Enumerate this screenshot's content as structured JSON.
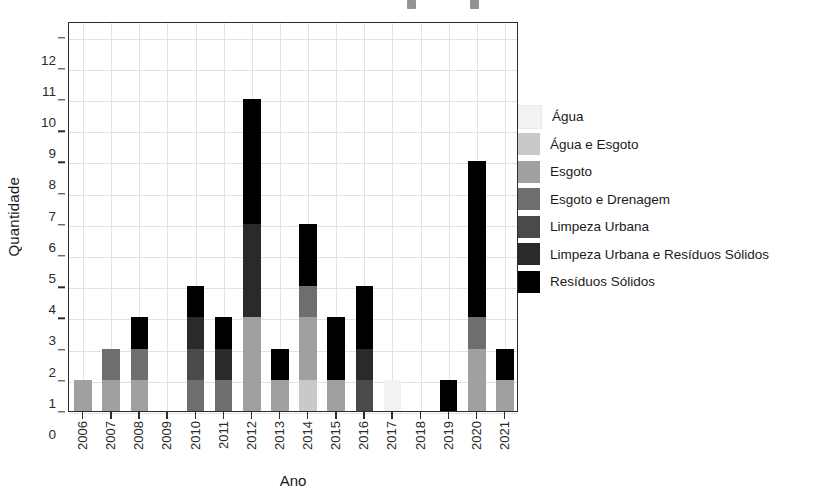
{
  "chart_data": {
    "type": "bar",
    "stacked": true,
    "title": "",
    "xlabel": "Ano",
    "ylabel": "Quantidade",
    "ylim": [
      0,
      12.5
    ],
    "yticks": [
      0,
      1,
      2,
      3,
      4,
      5,
      6,
      7,
      8,
      9,
      10,
      11,
      12
    ],
    "grid": true,
    "legend_position": "right",
    "categories": [
      "2006",
      "2007",
      "2008",
      "2009",
      "2010",
      "2011",
      "2012",
      "2013",
      "2014",
      "2015",
      "2016",
      "2017",
      "2018",
      "2019",
      "2020",
      "2021"
    ],
    "series": [
      {
        "name": "Água",
        "color": "#f2f2f2",
        "values": [
          0,
          0,
          0,
          0,
          0,
          0,
          0,
          0,
          0,
          0,
          0,
          1,
          0,
          0,
          0,
          0
        ]
      },
      {
        "name": "Água e Esgoto",
        "color": "#c9c9c9",
        "values": [
          0,
          0,
          0,
          0,
          0,
          0,
          0,
          0,
          1,
          0,
          0,
          0,
          0,
          0,
          0,
          0
        ]
      },
      {
        "name": "Esgoto",
        "color": "#a0a0a0",
        "values": [
          1,
          1,
          1,
          0,
          0,
          0,
          3,
          1,
          2,
          1,
          0,
          0,
          0,
          0,
          2,
          1
        ]
      },
      {
        "name": "Esgoto e Drenagem",
        "color": "#6e6e6e",
        "values": [
          0,
          1,
          1,
          0,
          1,
          1,
          0,
          0,
          1,
          0,
          0,
          0,
          0,
          0,
          1,
          0
        ]
      },
      {
        "name": "Limpeza Urbana",
        "color": "#4a4a4a",
        "values": [
          0,
          0,
          0,
          0,
          1,
          0,
          0,
          0,
          0,
          0,
          1,
          0,
          0,
          0,
          0,
          0
        ]
      },
      {
        "name": "Limpeza Urbana e Resíduos Sólidos",
        "color": "#2a2a2a",
        "values": [
          0,
          0,
          0,
          0,
          1,
          1,
          3,
          0,
          0,
          0,
          1,
          0,
          0,
          0,
          0,
          0
        ]
      },
      {
        "name": "Resíduos Sólidos",
        "color": "#000000",
        "values": [
          0,
          0,
          1,
          0,
          1,
          1,
          4,
          1,
          2,
          2,
          2,
          0,
          0,
          1,
          5,
          1
        ]
      }
    ],
    "totals": [
      1,
      2,
      3,
      0,
      4,
      3,
      10,
      2,
      6,
      3,
      4,
      1,
      0,
      1,
      8,
      2
    ]
  },
  "legend": {
    "items": [
      {
        "label": "Água"
      },
      {
        "label": "Água e Esgoto"
      },
      {
        "label": "Esgoto"
      },
      {
        "label": "Esgoto e Drenagem"
      },
      {
        "label": "Limpeza Urbana"
      },
      {
        "label": "Limpeza Urbana e Resíduos Sólidos"
      },
      {
        "label": "Resíduos Sólidos"
      }
    ]
  },
  "axes": {
    "y_title": "Quantidade",
    "x_title": "Ano",
    "y_tick_labels": [
      "0",
      "1",
      "2",
      "3",
      "4",
      "5",
      "6",
      "7",
      "8",
      "9",
      "10",
      "11",
      "12"
    ],
    "x_tick_labels": [
      "2006",
      "2007",
      "2008",
      "2009",
      "2010",
      "2011",
      "2012",
      "2013",
      "2014",
      "2015",
      "2016",
      "2017",
      "2018",
      "2019",
      "2020",
      "2021"
    ]
  }
}
